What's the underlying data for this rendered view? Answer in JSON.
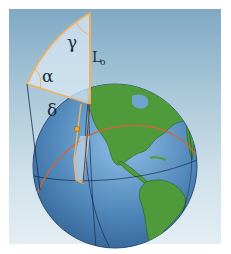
{
  "diagram": {
    "labels": {
      "gamma": "γ",
      "alpha": "α",
      "delta": "δ",
      "L": "L",
      "L_sub": "o"
    },
    "colors": {
      "sky_top": "#7fa9c4",
      "sky_bottom": "#e4eef3",
      "ocean": "#4f86b8",
      "land": "#4f9a3a",
      "triangle_outline": "#f0b060",
      "triangle_fill": "#d9e8f4",
      "great_circle": "#d0643a",
      "meridian": "#1a2a4a",
      "observer_point": "#f5a623"
    }
  }
}
